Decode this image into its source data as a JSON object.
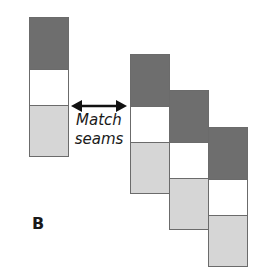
{
  "figure": {
    "panel_label": "B",
    "annotation": {
      "line1": "Match",
      "line2": "seams"
    },
    "colors": {
      "dark": "#6e6e6e",
      "white": "#ffffff",
      "light": "#d6d6d6",
      "border": "#6b6b6b"
    },
    "strips": [
      {
        "name": "reference-strip",
        "x": 29,
        "top": 17,
        "segments": [
          "dark",
          "white",
          "light"
        ]
      },
      {
        "name": "strip-1",
        "x": 130,
        "top": 54,
        "segments": [
          "dark",
          "white",
          "light"
        ]
      },
      {
        "name": "strip-2",
        "x": 169,
        "top": 90,
        "segments": [
          "dark",
          "white",
          "light"
        ]
      },
      {
        "name": "strip-3",
        "x": 208,
        "top": 127,
        "segments": [
          "dark",
          "white",
          "light"
        ]
      }
    ]
  }
}
